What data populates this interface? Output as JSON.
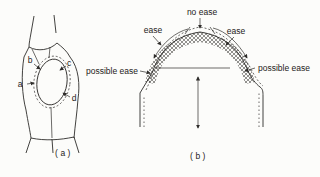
{
  "figure_a": {
    "caption": "(a)",
    "points": {
      "a": "a",
      "b": "b",
      "c": "c",
      "d": "d"
    }
  },
  "figure_b": {
    "caption": "(b)",
    "labels": {
      "no_ease": "no ease",
      "ease_left": "ease",
      "ease_right": "ease",
      "possible_ease_left": "possible ease",
      "possible_ease_right": "possible ease"
    }
  },
  "colors": {
    "ink": "#2e2c2a",
    "background": "#fcfcfa"
  }
}
